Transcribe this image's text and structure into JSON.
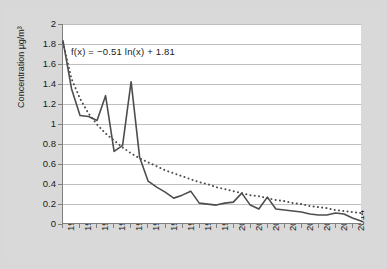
{
  "chart_data": {
    "type": "line",
    "title": "",
    "xlabel": "",
    "ylabel": "Concentration μg/m³",
    "xlim": [
      1980,
      2015
    ],
    "ylim": [
      0,
      2
    ],
    "ytick_step": 0.2,
    "xtick_step": 2,
    "grid": "horizontal",
    "legend": "none",
    "annotation": "f(x) = −0.51 ln(x) + 1.81",
    "x_tick_labels": [
      "1980",
      "1982",
      "1984",
      "1986",
      "1988",
      "1990",
      "1992",
      "1994",
      "1996",
      "1998",
      "2000",
      "2002",
      "2004",
      "2006",
      "2008",
      "2010",
      "2012",
      "2014"
    ],
    "y_tick_labels": [
      "0",
      "0.2",
      "0.4",
      "0.6",
      "0.8",
      "1",
      "1.2",
      "1.4",
      "1.6",
      "1.8",
      "2"
    ],
    "x": [
      1980,
      1981,
      1982,
      1983,
      1984,
      1985,
      1986,
      1987,
      1988,
      1989,
      1990,
      1991,
      1992,
      1993,
      1994,
      1995,
      1996,
      1997,
      1998,
      1999,
      2000,
      2001,
      2002,
      2003,
      2004,
      2005,
      2006,
      2007,
      2008,
      2009,
      2010,
      2011,
      2012,
      2013,
      2014,
      2015
    ],
    "series": [
      {
        "name": "Concentration",
        "style": "solid",
        "color": "#4d4d4d",
        "values": [
          1.83,
          1.35,
          1.08,
          1.07,
          1.03,
          1.28,
          0.72,
          0.78,
          1.42,
          0.66,
          0.42,
          0.36,
          0.31,
          0.25,
          0.28,
          0.32,
          0.2,
          0.19,
          0.18,
          0.2,
          0.21,
          0.3,
          0.18,
          0.14,
          0.26,
          0.14,
          0.13,
          0.12,
          0.11,
          0.09,
          0.08,
          0.08,
          0.1,
          0.09,
          0.05,
          0.02
        ]
      },
      {
        "name": "Logarithmic trendline",
        "style": "dotted",
        "color": "#4d4d4d",
        "values": [
          1.81,
          1.45,
          1.25,
          1.1,
          0.99,
          0.9,
          0.83,
          0.76,
          0.7,
          0.65,
          0.61,
          0.57,
          0.53,
          0.5,
          0.47,
          0.44,
          0.41,
          0.39,
          0.36,
          0.34,
          0.32,
          0.3,
          0.28,
          0.27,
          0.25,
          0.23,
          0.22,
          0.2,
          0.19,
          0.17,
          0.16,
          0.15,
          0.13,
          0.12,
          0.11,
          0.1
        ]
      }
    ]
  }
}
